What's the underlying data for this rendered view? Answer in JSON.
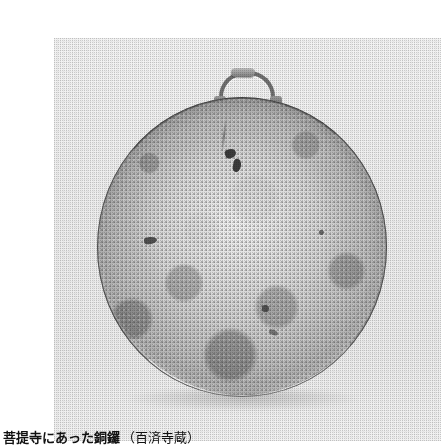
{
  "page": {
    "background_color": "#ffffff",
    "width": 413,
    "height": 447
  },
  "figure": {
    "name": "bronze-gong-photograph",
    "medium": "halftone printed photograph",
    "subject_alt_text": "銅鑼",
    "plate_background_color": "#eeeeee",
    "object": {
      "name": "dora-gong",
      "shape": "circular disc",
      "surface": "mottled weathered bronze patina",
      "has_suspension_loop": true,
      "loop_label": "吊り手",
      "dominant_color": "#b6b6b6",
      "rim_color": "#3b3b3b",
      "highlight_color": "#eeeeee"
    }
  },
  "caption": {
    "main": "菩提寺にあった銅鑼",
    "sub": "（百済寺蔵）",
    "full": "菩提寺にあった銅鑼（百済寺蔵）",
    "text_color": "#111111"
  }
}
